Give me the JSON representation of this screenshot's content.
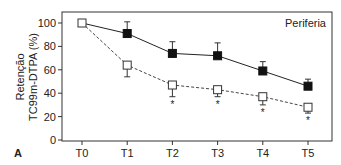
{
  "panel_label": "A",
  "chart_data": {
    "type": "line",
    "title": "",
    "annotation": "Periferia",
    "xlabel": "",
    "ylabel_line1": "Retenção",
    "ylabel_line2": "TC99m-DTPA (%)",
    "ylim": [
      0,
      100
    ],
    "yticks": [
      0,
      20,
      40,
      60,
      80,
      100
    ],
    "categories": [
      "T0",
      "T1",
      "T2",
      "T3",
      "T4",
      "T5"
    ],
    "series": [
      {
        "name": "filled-squares-solid",
        "marker": "filled-square",
        "line": "solid",
        "values": [
          100,
          91,
          74,
          72,
          59,
          46
        ],
        "error_up": [
          0,
          10,
          10,
          11,
          8,
          6
        ]
      },
      {
        "name": "open-squares-dashed",
        "marker": "open-square",
        "line": "dashed",
        "values": [
          100,
          64,
          47,
          43,
          37,
          28
        ],
        "error_down": [
          0,
          10,
          10,
          6,
          7,
          5
        ]
      }
    ],
    "significance_markers": [
      "T2",
      "T3",
      "T4",
      "T5"
    ],
    "grid": false
  }
}
